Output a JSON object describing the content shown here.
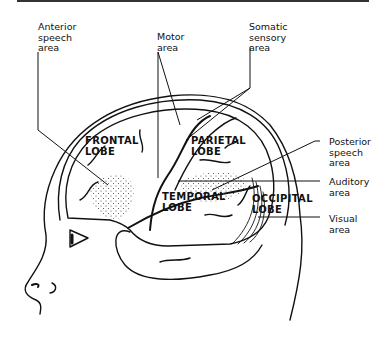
{
  "diagram": {
    "colors": {
      "line": "#111111",
      "background": "#ffffff",
      "stipple": "#444444"
    },
    "lobes": [
      {
        "id": "frontal",
        "label": "FRONTAL\nLOBE"
      },
      {
        "id": "parietal",
        "label": "PARIETAL\nLOBE"
      },
      {
        "id": "temporal",
        "label": "TEMPORAL\nLOBE"
      },
      {
        "id": "occipital",
        "label": "OCCIPITAL\nLOBE"
      }
    ],
    "callouts": [
      {
        "id": "anterior-speech",
        "label": "Anterior\nspeech\narea"
      },
      {
        "id": "motor",
        "label": "Motor\narea"
      },
      {
        "id": "somatic-sensory",
        "label": "Somatic\nsensory\narea"
      },
      {
        "id": "posterior-speech",
        "label": "Posterior\nspeech\narea"
      },
      {
        "id": "auditory",
        "label": "Auditory\narea"
      },
      {
        "id": "visual",
        "label": "Visual\narea"
      }
    ]
  }
}
